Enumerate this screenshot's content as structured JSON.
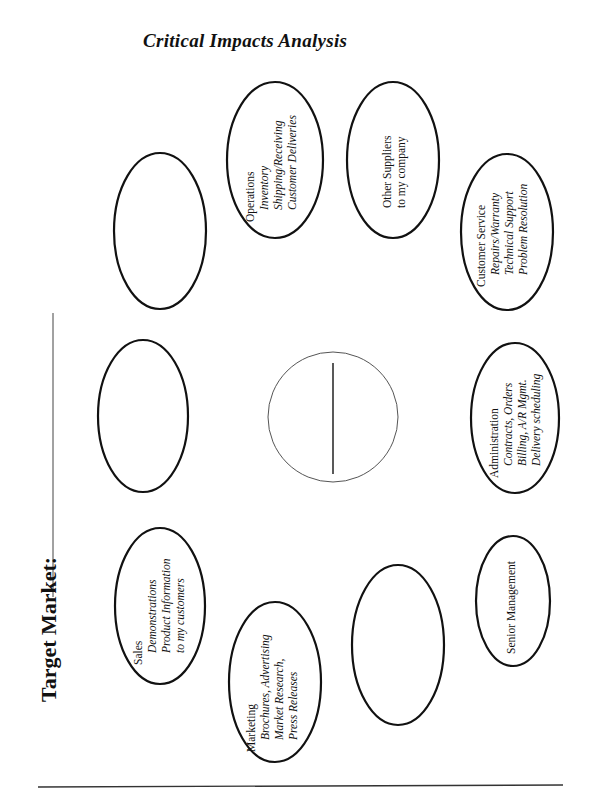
{
  "title": "Critical Impacts Analysis",
  "target_market": {
    "label": "Target Market:"
  },
  "center": {
    "shape": "circle-divided-vertical"
  },
  "nodes": [
    {
      "id": "operations",
      "heading": "Operations",
      "items": [
        "Inventory",
        "Shipping/Receiving",
        "Customer Deliveries"
      ]
    },
    {
      "id": "other-suppliers",
      "heading": "Other Suppliers",
      "items": [
        "to my company"
      ],
      "items_plain": true
    },
    {
      "id": "customer-service",
      "heading": "Customer Service",
      "items": [
        "Repairs/Warranty",
        "Technical Support",
        "Problem Resolution"
      ]
    },
    {
      "id": "administration",
      "heading": "Administration",
      "items": [
        "Contracts, Orders",
        "Billing, A/R Mgmt.",
        "Delivery scheduling"
      ]
    },
    {
      "id": "senior-management",
      "heading": "Senior Management",
      "items": []
    },
    {
      "id": "marketing",
      "heading": "Marketing",
      "items": [
        "Brochures, Advertising",
        "Market Research,",
        "Press Releases"
      ]
    },
    {
      "id": "sales",
      "heading": "Sales",
      "items": [
        "Demonstrations",
        "Product Information",
        "to my customers"
      ]
    },
    {
      "id": "blank-1",
      "heading": "",
      "items": []
    },
    {
      "id": "blank-2",
      "heading": "",
      "items": []
    },
    {
      "id": "blank-3",
      "heading": "",
      "items": []
    }
  ]
}
